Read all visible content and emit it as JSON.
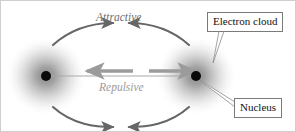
{
  "figure": {
    "background_color": "#ffffff",
    "border_color": "#cfcfcf",
    "width": 296,
    "height": 132
  },
  "labels": {
    "attractive": "Attractive",
    "repulsive": "Repulsive",
    "electron_cloud": "Electron cloud",
    "nucleus": "Nucleus"
  },
  "colors": {
    "attractive_arrow": "#666666",
    "repulsive_arrow": "#9b9b9b",
    "attractive_text": "#6f6f6f",
    "repulsive_text": "#9a9a9a",
    "nucleus_dot": "#0a0a0a",
    "electron_cloud_core": "#8a8a8a",
    "callout_border": "#7a7a7a",
    "callout_text": "#111111",
    "leader_line": "#8c8c8c",
    "axis_line": "#a9a9a9"
  },
  "atoms": [
    {
      "name": "left-atom",
      "cx": 45,
      "cy": 75,
      "cloud_radius": 40,
      "nucleus_radius": 5
    },
    {
      "name": "right-atom",
      "cx": 195,
      "cy": 75,
      "cloud_radius": 40,
      "nucleus_radius": 5
    }
  ],
  "arrows": {
    "attractive_top_left": {
      "from": "left-atom",
      "direction": "inward-up"
    },
    "attractive_top_right": {
      "from": "right-atom",
      "direction": "inward-up"
    },
    "attractive_bottom_left": {
      "from": "left-atom",
      "direction": "inward-down"
    },
    "attractive_bottom_right": {
      "from": "right-atom",
      "direction": "inward-down"
    },
    "repulsive_left": {
      "direction": "outward-left"
    },
    "repulsive_right": {
      "direction": "outward-right"
    }
  },
  "callout_leaders": {
    "electron_cloud": {
      "target": "right-atom-cloud-edge"
    },
    "nucleus": {
      "target": "right-atom-nucleus"
    }
  }
}
